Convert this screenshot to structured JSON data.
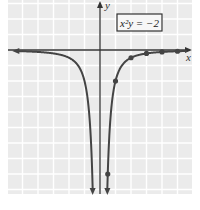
{
  "chart_data": {
    "type": "line",
    "title": "",
    "equation_label": "x²y = −2",
    "equation": "y = -2/x^2",
    "xlabel": "x",
    "ylabel": "y",
    "xlim": [
      -6,
      6
    ],
    "ylim": [
      -9.3,
      3.2
    ],
    "grid": true,
    "legend_position": "upper right (boxed equation label)",
    "series": [
      {
        "name": "x²y = −2",
        "curve": "y = -2/x^2",
        "branches": [
          "x < 0",
          "x > 0"
        ],
        "arrows": [
          "left branch toward -x (approaches 0)",
          "left branch down (to -infinity near x=0)",
          "right branch down (to -infinity near x=0)"
        ],
        "marked_points": [
          {
            "x": 0.5,
            "y": -8
          },
          {
            "x": 1,
            "y": -2
          },
          {
            "x": 2,
            "y": -0.5
          },
          {
            "x": 3,
            "y": -0.22
          },
          {
            "x": 4,
            "y": -0.125
          },
          {
            "x": 5,
            "y": -0.08
          }
        ]
      }
    ]
  },
  "labels": {
    "x_axis": "x",
    "y_axis": "y",
    "equation_box": "x²y = −2"
  },
  "colors": {
    "grid_background": "#ebebeb",
    "grid_lines": "#ffffff",
    "curve": "#444444",
    "axes": "#333333",
    "label_box_border": "#333333",
    "label_box_bg": "#f7f7f7"
  }
}
